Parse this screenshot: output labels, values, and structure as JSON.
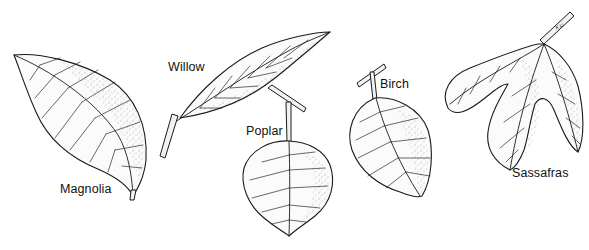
{
  "figure": {
    "background": "#ffffff",
    "ink_color": "#1a1a1a",
    "leaves": [
      {
        "id": "magnolia",
        "label": "Magnolia"
      },
      {
        "id": "willow",
        "label": "Willow"
      },
      {
        "id": "poplar",
        "label": "Poplar"
      },
      {
        "id": "birch",
        "label": "Birch"
      },
      {
        "id": "sassafras",
        "label": "Sassafras"
      }
    ],
    "signature": "K.Li"
  }
}
